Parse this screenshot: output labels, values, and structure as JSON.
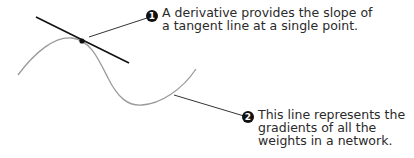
{
  "annotations": [
    {
      "number": "1",
      "lines": [
        "A derivative provides the slope of",
        "a tangent line at a single point."
      ]
    },
    {
      "number": "2",
      "lines": [
        "This line represents the",
        "gradients of all the",
        "weights in a network."
      ]
    }
  ],
  "colors": {
    "curve": "#9a9a9a",
    "tangent": "#111111",
    "leader": "#333333",
    "badge": "#111111",
    "text": "#2a2a2a"
  }
}
